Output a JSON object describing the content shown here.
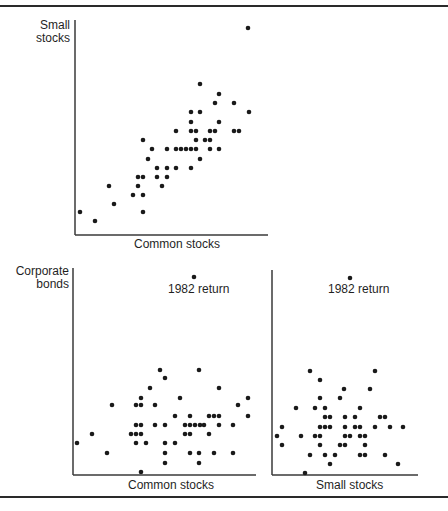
{
  "figure": {
    "ink_color": "#1a1a1a",
    "background": "#ffffff"
  },
  "chart_data": [
    {
      "type": "scatter",
      "title": "",
      "xlabel": "Common stocks",
      "ylabel": "Small stocks",
      "ylabel_lines": [
        "Small",
        "stocks"
      ],
      "grid": false,
      "ticks": false,
      "axes_px": {
        "x0": 75,
        "y0": 235,
        "x1": 268,
        "y1": 20
      },
      "points_px": [
        [
          248,
          28
        ],
        [
          200,
          84
        ],
        [
          219,
          94
        ],
        [
          215,
          103
        ],
        [
          234,
          103
        ],
        [
          191,
          112
        ],
        [
          200,
          112
        ],
        [
          249,
          112
        ],
        [
          191,
          122
        ],
        [
          219,
          122
        ],
        [
          176,
          131
        ],
        [
          191,
          131
        ],
        [
          196,
          131
        ],
        [
          210,
          131
        ],
        [
          215,
          131
        ],
        [
          234,
          131
        ],
        [
          239,
          131
        ],
        [
          196,
          140
        ],
        [
          205,
          140
        ],
        [
          210,
          140
        ],
        [
          143,
          140
        ],
        [
          152,
          149
        ],
        [
          167,
          149
        ],
        [
          176,
          149
        ],
        [
          181,
          149
        ],
        [
          186,
          149
        ],
        [
          191,
          149
        ],
        [
          196,
          149
        ],
        [
          210,
          149
        ],
        [
          219,
          149
        ],
        [
          148,
          159
        ],
        [
          200,
          159
        ],
        [
          157,
          168
        ],
        [
          167,
          168
        ],
        [
          176,
          168
        ],
        [
          191,
          168
        ],
        [
          138,
          177
        ],
        [
          143,
          177
        ],
        [
          157,
          177
        ],
        [
          167,
          177
        ],
        [
          109,
          186
        ],
        [
          138,
          186
        ],
        [
          162,
          186
        ],
        [
          133,
          195
        ],
        [
          143,
          195
        ],
        [
          114,
          204
        ],
        [
          80,
          212
        ],
        [
          143,
          212
        ],
        [
          95,
          221
        ]
      ]
    },
    {
      "type": "scatter",
      "title": "",
      "xlabel": "Common stocks",
      "ylabel": "Corporate bonds",
      "ylabel_lines": [
        "Corporate",
        "bonds"
      ],
      "grid": false,
      "ticks": false,
      "annotation": {
        "text": "1982 return",
        "point_px": [
          194,
          277
        ]
      },
      "axes_px": {
        "x0": 73,
        "y0": 475,
        "x1": 256,
        "y1": 268
      },
      "points_px": [
        [
          194,
          277
        ],
        [
          160,
          370
        ],
        [
          199,
          370
        ],
        [
          165,
          378
        ],
        [
          150,
          388
        ],
        [
          219,
          388
        ],
        [
          141,
          398
        ],
        [
          180,
          398
        ],
        [
          248,
          398
        ],
        [
          112,
          405
        ],
        [
          136,
          405
        ],
        [
          141,
          405
        ],
        [
          155,
          405
        ],
        [
          238,
          405
        ],
        [
          175,
          416
        ],
        [
          190,
          416
        ],
        [
          209,
          416
        ],
        [
          214,
          416
        ],
        [
          219,
          416
        ],
        [
          248,
          416
        ],
        [
          136,
          425
        ],
        [
          141,
          425
        ],
        [
          155,
          425
        ],
        [
          165,
          425
        ],
        [
          185,
          425
        ],
        [
          190,
          425
        ],
        [
          195,
          425
        ],
        [
          200,
          425
        ],
        [
          204,
          425
        ],
        [
          219,
          425
        ],
        [
          233,
          425
        ],
        [
          92,
          434
        ],
        [
          131,
          434
        ],
        [
          136,
          434
        ],
        [
          141,
          434
        ],
        [
          185,
          434
        ],
        [
          190,
          434
        ],
        [
          209,
          434
        ],
        [
          77,
          443
        ],
        [
          136,
          443
        ],
        [
          146,
          443
        ],
        [
          165,
          443
        ],
        [
          175,
          443
        ],
        [
          107,
          453
        ],
        [
          165,
          453
        ],
        [
          190,
          453
        ],
        [
          199,
          453
        ],
        [
          214,
          453
        ],
        [
          233,
          453
        ],
        [
          165,
          463
        ],
        [
          199,
          463
        ],
        [
          141,
          472
        ]
      ]
    },
    {
      "type": "scatter",
      "title": "",
      "xlabel": "Small stocks",
      "ylabel": "Corporate bonds",
      "grid": false,
      "ticks": false,
      "annotation": {
        "text": "1982 return",
        "point_px": [
          350,
          278
        ]
      },
      "axes_px": {
        "x0": 272,
        "y0": 475,
        "x1": 418,
        "y1": 270
      },
      "points_px": [
        [
          350,
          278
        ],
        [
          310,
          371
        ],
        [
          375,
          371
        ],
        [
          320,
          380
        ],
        [
          344,
          389
        ],
        [
          370,
          389
        ],
        [
          320,
          398
        ],
        [
          340,
          398
        ],
        [
          296,
          408
        ],
        [
          315,
          408
        ],
        [
          325,
          408
        ],
        [
          360,
          408
        ],
        [
          325,
          417
        ],
        [
          330,
          417
        ],
        [
          345,
          417
        ],
        [
          355,
          417
        ],
        [
          380,
          417
        ],
        [
          385,
          417
        ],
        [
          282,
          427
        ],
        [
          320,
          427
        ],
        [
          325,
          427
        ],
        [
          330,
          427
        ],
        [
          345,
          427
        ],
        [
          355,
          427
        ],
        [
          360,
          427
        ],
        [
          375,
          427
        ],
        [
          390,
          427
        ],
        [
          403,
          427
        ],
        [
          277,
          436
        ],
        [
          301,
          436
        ],
        [
          315,
          436
        ],
        [
          320,
          436
        ],
        [
          345,
          436
        ],
        [
          350,
          436
        ],
        [
          360,
          436
        ],
        [
          365,
          436
        ],
        [
          282,
          445
        ],
        [
          320,
          445
        ],
        [
          340,
          445
        ],
        [
          345,
          445
        ],
        [
          365,
          445
        ],
        [
          310,
          455
        ],
        [
          325,
          455
        ],
        [
          335,
          455
        ],
        [
          360,
          455
        ],
        [
          365,
          455
        ],
        [
          385,
          455
        ],
        [
          330,
          464
        ],
        [
          398,
          464
        ],
        [
          305,
          473
        ]
      ]
    }
  ]
}
